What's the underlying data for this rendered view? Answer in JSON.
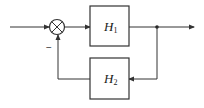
{
  "diagram": {
    "type": "feedback-block-diagram",
    "colors": {
      "stroke": "#333333",
      "background": "#ffffff"
    },
    "summing_junction": {
      "symbol": "⊗",
      "feedback_sign": "−"
    },
    "blocks": [
      {
        "id": "H1",
        "label": "H",
        "subscript": "1",
        "position": "forward-path"
      },
      {
        "id": "H2",
        "label": "H",
        "subscript": "2",
        "position": "feedback-path"
      }
    ],
    "connections": [
      {
        "from": "input",
        "to": "summing_junction"
      },
      {
        "from": "summing_junction",
        "to": "H1"
      },
      {
        "from": "H1",
        "to": "branch_point"
      },
      {
        "from": "branch_point",
        "to": "output"
      },
      {
        "from": "branch_point",
        "to": "H2"
      },
      {
        "from": "H2",
        "to": "summing_junction",
        "sign": "−"
      }
    ]
  }
}
